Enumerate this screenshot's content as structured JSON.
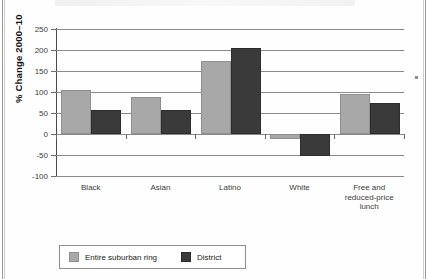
{
  "chart_data": {
    "type": "bar",
    "title": "",
    "xlabel": "",
    "ylabel": "% Change 2000–10",
    "ylim": [
      -100,
      250
    ],
    "yticks": [
      250,
      200,
      150,
      100,
      50,
      0,
      -50,
      -100
    ],
    "ytick_labels": [
      "250",
      "200",
      "150",
      "100",
      "50",
      "0",
      "-50",
      "-100"
    ],
    "grid": true,
    "legend_position": "bottom-left",
    "categories": [
      "Black",
      "Asian",
      "Latino",
      "White",
      "Free and reduced-price lunch"
    ],
    "category_lines": [
      [
        "Black"
      ],
      [
        "Asian"
      ],
      [
        "Latino"
      ],
      [
        "White"
      ],
      [
        "Free and",
        "reduced-price",
        "lunch"
      ]
    ],
    "series": [
      {
        "name": "Entire suburban ring",
        "color": "#a8a8a8",
        "values": [
          105,
          87,
          174,
          -12,
          96
        ]
      },
      {
        "name": "District",
        "color": "#3a3a3a",
        "values": [
          58,
          58,
          205,
          -52,
          73
        ]
      }
    ]
  },
  "legend": {
    "items": [
      {
        "label": "Entire suburban ring",
        "color": "#a8a8a8"
      },
      {
        "label": "District",
        "color": "#3a3a3a"
      }
    ]
  },
  "colors": {
    "series_light": "#a8a8a8",
    "series_dark": "#3a3a3a",
    "gridline": "#8a8a8a",
    "axis": "#4a4a4a",
    "text": "#3c3c3c",
    "page_rule": "#9a9a9a"
  }
}
